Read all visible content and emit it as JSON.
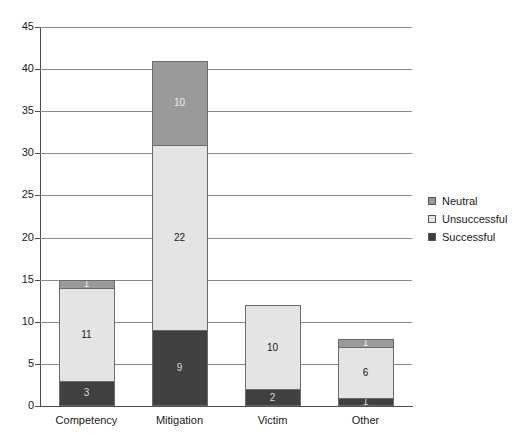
{
  "chart_data": {
    "type": "bar",
    "subtype": "stacked-vertical",
    "title": "",
    "xlabel": "",
    "ylabel": "",
    "categories": [
      "Competency",
      "Mitigation",
      "Victim",
      "Other"
    ],
    "series": [
      {
        "name": "Successful",
        "color": "#404040",
        "values": [
          3,
          9,
          2,
          1
        ]
      },
      {
        "name": "Unsuccessful",
        "color": "#e4e4e4",
        "values": [
          11,
          22,
          10,
          6
        ]
      },
      {
        "name": "Neutral",
        "color": "#9a9a9a",
        "values": [
          1,
          10,
          0,
          1
        ]
      }
    ],
    "stack_totals": [
      15,
      41,
      12,
      8
    ],
    "ylim": [
      0,
      45
    ],
    "ytick_step": 5,
    "ytick_labels": [
      "0",
      "5",
      "10",
      "15",
      "20",
      "25",
      "30",
      "35",
      "40",
      "45"
    ],
    "grid": true,
    "grid_axis": "y",
    "legend_position": "right",
    "legend_order": [
      "Neutral",
      "Unsuccessful",
      "Successful"
    ],
    "data_labels_shown": true,
    "bar_labels": {
      "Competency": {
        "Successful": "3",
        "Unsuccessful": "11",
        "Neutral": "1"
      },
      "Mitigation": {
        "Successful": "9",
        "Unsuccessful": "22",
        "Neutral": "10"
      },
      "Victim": {
        "Successful": "2",
        "Unsuccessful": "10",
        "Neutral": ""
      },
      "Other": {
        "Successful": "1",
        "Unsuccessful": "6",
        "Neutral": "1"
      }
    }
  },
  "legend": {
    "items": [
      {
        "label": "Neutral",
        "color": "#9a9a9a"
      },
      {
        "label": "Unsuccessful",
        "color": "#e4e4e4"
      },
      {
        "label": "Successful",
        "color": "#404040"
      }
    ]
  },
  "axis": {
    "y_labels": [
      "45",
      "40",
      "35",
      "30",
      "25",
      "20",
      "15",
      "10",
      "5",
      "0"
    ]
  }
}
